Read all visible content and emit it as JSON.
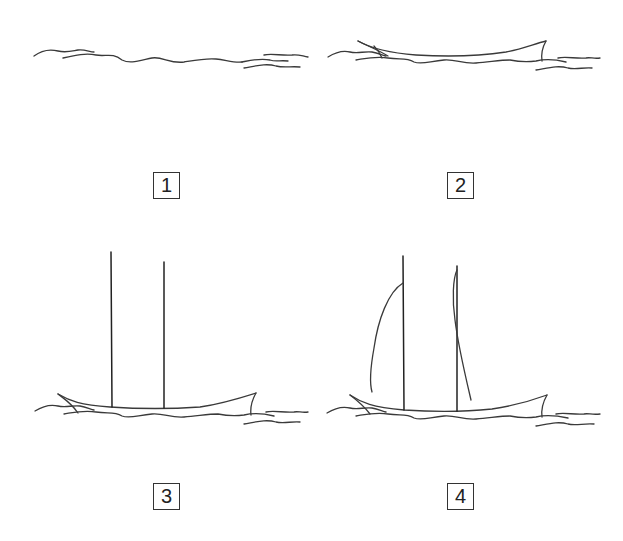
{
  "figure": {
    "type": "sequence-diagram",
    "panels": [
      {
        "number": "1",
        "content": "waves"
      },
      {
        "number": "2",
        "content": "hull on waves"
      },
      {
        "number": "3",
        "content": "hull with two masts"
      },
      {
        "number": "4",
        "content": "hull with two masts and sail outlines"
      }
    ],
    "stroke_color": "#3a3a3a",
    "background": "#ffffff"
  }
}
